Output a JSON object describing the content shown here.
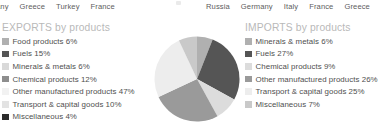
{
  "top_labels": {
    "left_group": [
      "any",
      "Greece",
      "Turkey",
      "France"
    ],
    "right_group": [
      "Russia",
      "Germany",
      "Italy",
      "France",
      "Greece"
    ]
  },
  "exports": {
    "title": "EXPORTS by products",
    "items": [
      {
        "label": "Food products 6%",
        "color": "#b0b0b0"
      },
      {
        "label": "Fuels 15%",
        "color": "#555555"
      },
      {
        "label": "Minerals & metals 6%",
        "color": "#d9d9d9"
      },
      {
        "label": "Chemical products 12%",
        "color": "#8e8e8e"
      },
      {
        "label": "Other manufactured products 47%",
        "color": "#f2f2f2"
      },
      {
        "label": "Transport & capital goods 10%",
        "color": "#e3e3e3"
      },
      {
        "label": "Miscellaneous 4%",
        "color": "#2b2b2b"
      }
    ]
  },
  "imports": {
    "title": "IMPORTS by products",
    "items": [
      {
        "label": "Minerals & metals 6%",
        "color": "#b0b0b0"
      },
      {
        "label": "Fuels 27%",
        "color": "#555555"
      },
      {
        "label": "Chemical products 9%",
        "color": "#dcdcdc"
      },
      {
        "label": "Other manufactured products 26%",
        "color": "#9a9a9a"
      },
      {
        "label": "Transport & capital goods 25%",
        "color": "#ededed"
      },
      {
        "label": "Miscellaneous 7%",
        "color": "#c9c9c9"
      }
    ]
  },
  "chart_data": {
    "type": "pie",
    "title": "IMPORTS by products",
    "legend_position": "right",
    "start_angle_deg": -90,
    "direction": "clockwise",
    "categories": [
      "Minerals & metals",
      "Fuels",
      "Chemical products",
      "Other manufactured products",
      "Transport & capital goods",
      "Miscellaneous"
    ],
    "values": [
      6,
      27,
      9,
      26,
      25,
      7
    ],
    "unit": "%",
    "colors": [
      "#b0b0b0",
      "#555555",
      "#dcdcdc",
      "#9a9a9a",
      "#ededed",
      "#c9c9c9"
    ]
  }
}
